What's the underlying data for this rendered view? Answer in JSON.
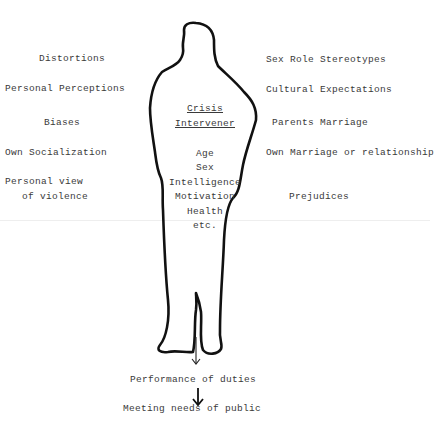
{
  "diagram": {
    "title": [
      "Crisis",
      "Intervener"
    ],
    "left_factors": [
      "Distortions",
      "Personal Perceptions",
      "Biases",
      "Own Socialization",
      "Personal view",
      "of violence"
    ],
    "right_factors": [
      "Sex Role Stereotypes",
      "Cultural Expectations",
      "Parents Marriage",
      "Own Marriage or relationship",
      "Prejudices"
    ],
    "inner_attributes": [
      "Age",
      "Sex",
      "Intelligence",
      "Motivation",
      "Health",
      "etc."
    ],
    "flow": [
      "Performance of duties",
      "Meeting needs of public"
    ],
    "colors": {
      "ink": "#111111",
      "text": "#3a3a3a",
      "background": "#ffffff"
    }
  }
}
